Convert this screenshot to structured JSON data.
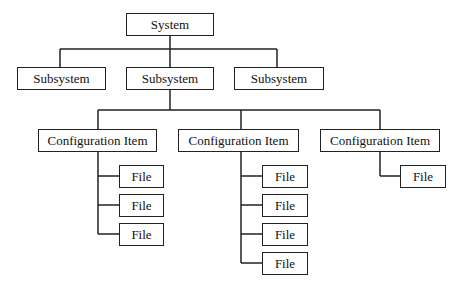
{
  "root": {
    "label": "System"
  },
  "subsystems": [
    {
      "label": "Subsystem"
    },
    {
      "label": "Subsystem"
    },
    {
      "label": "Subsystem"
    }
  ],
  "configuration_items": [
    {
      "label": "Configuration Item",
      "files": [
        "File",
        "File",
        "File"
      ]
    },
    {
      "label": "Configuration Item",
      "files": [
        "File",
        "File",
        "File",
        "File"
      ]
    },
    {
      "label": "Configuration Item",
      "files": [
        "File"
      ]
    }
  ],
  "colors": {
    "line": "#222222",
    "box_border": "#222222",
    "background": "#ffffff"
  }
}
